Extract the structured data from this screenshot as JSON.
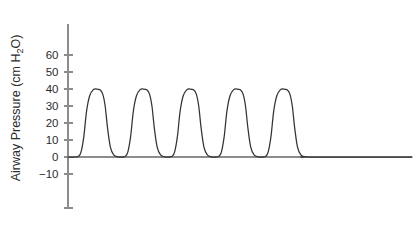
{
  "chart_data": {
    "type": "line",
    "title": "",
    "subtitle": "",
    "xlabel": "",
    "ylabel": "Airway Pressure (cm H2O)",
    "ylabel_parts": {
      "prefix": "Airway Pressure (cm H",
      "subscript": "2",
      "suffix": "O)"
    },
    "grid": false,
    "legend": null,
    "ylim": [
      -30,
      65
    ],
    "xlim": [
      0,
      100
    ],
    "y_ticks": [
      60,
      50,
      40,
      30,
      20,
      10,
      0,
      -10,
      -30
    ],
    "y_tick_labels": [
      "60",
      "50",
      "40",
      "30",
      "20",
      "10",
      "0",
      "-10",
      ""
    ],
    "x_ticks": [],
    "x_tick_labels": [],
    "baseline_value": 0,
    "annotations": [],
    "series": [
      {
        "name": "Airway pressure waveform",
        "color": "#333333",
        "peak_value": 40,
        "trough_value": 0,
        "cycle_count": 5,
        "cycle_period_x": 13.6,
        "first_peak_x": 8.3,
        "description": "Pressure-controlled ventilation: repeating square-ish pressure pulses rising from 0 to 40 cm H2O with rounded peaks and rapid decay back to baseline.",
        "points_per_cycle_x_offsets": [
          0.0,
          0.8,
          1.5,
          2.3,
          3.1,
          4.0,
          5.0,
          6.0,
          7.0,
          7.8,
          8.5,
          9.2,
          10.0,
          11.0,
          12.2,
          13.6
        ],
        "points_per_cycle_y": [
          0,
          0.5,
          3,
          12,
          27,
          36,
          39.5,
          40,
          39.5,
          37,
          30,
          17,
          6,
          1.2,
          0.1,
          0
        ]
      }
    ],
    "colors": {
      "trace": "#333333",
      "axis": "#8c8c8c",
      "baseline": "#8c8c8c",
      "text": "#2b2b2b",
      "background": "#ffffff"
    }
  },
  "geometry": {
    "axis_x": 68,
    "axis_top_y": 24,
    "axis_bottom_y": 208,
    "baseline_y": 157,
    "plot_right_x": 412,
    "pixels_per_unit_y": 1.7,
    "tick_length": 9,
    "tick_label_gap": 5,
    "ylabel_x": 20,
    "ylabel_center_y": 108
  }
}
